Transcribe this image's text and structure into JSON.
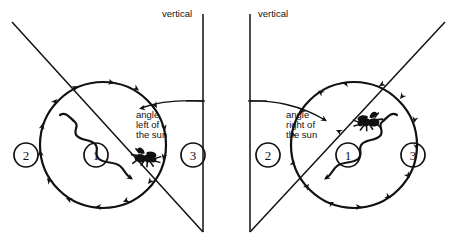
{
  "figure": {
    "name": "bee-waggle-dance-orientation-diagram",
    "background_color": "#ffffff",
    "ink_color": "#111111",
    "width": 457,
    "height": 248
  },
  "panels": [
    {
      "id": "left-panel",
      "side": "left",
      "vertical_label": "vertical",
      "angle_label_lines": [
        "angle",
        "left of",
        "the sun"
      ],
      "angle_label_text": "angle left of the sun",
      "dance_direction": "clockwise",
      "sun_ray_direction": "upper-left",
      "markers": [
        {
          "label": "1",
          "position": "center"
        },
        {
          "label": "2",
          "position": "left"
        },
        {
          "label": "3",
          "position": "right"
        }
      ]
    },
    {
      "id": "right-panel",
      "side": "right",
      "vertical_label": "vertical",
      "angle_label_lines": [
        "angle",
        "right of",
        "the sun"
      ],
      "angle_label_text": "angle right of the sun",
      "dance_direction": "counterclockwise",
      "sun_ray_direction": "upper-right",
      "markers": [
        {
          "label": "2",
          "position": "left"
        },
        {
          "label": "1",
          "position": "center"
        },
        {
          "label": "3",
          "position": "right"
        }
      ]
    }
  ],
  "icons": {
    "bee": "bee-icon",
    "arrowhead": "arrowhead-icon",
    "waggle": "waggle-path-icon"
  }
}
